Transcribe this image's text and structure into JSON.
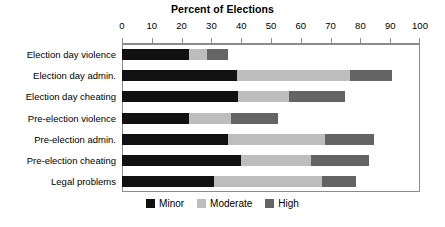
{
  "chart_data": {
    "type": "bar",
    "orientation": "horizontal",
    "stacked": true,
    "title": "Percent of Elections",
    "xlabel": "",
    "ylabel": "",
    "xlim": [
      0,
      100
    ],
    "grid": false,
    "legend_position": "bottom",
    "tick_labels": [
      "0",
      "10",
      "20",
      "30",
      "40",
      "50",
      "60",
      "70",
      "80",
      "90",
      "100"
    ],
    "tick_values": [
      0,
      10,
      20,
      30,
      40,
      50,
      60,
      70,
      80,
      90,
      100
    ],
    "categories": [
      "Election day violence",
      "Election day admin.",
      "Election day cheating",
      "Pre-election violence",
      "Pre-election admin.",
      "Pre-election cheating",
      "Legal problems"
    ],
    "series": [
      {
        "name": "Minor",
        "color": "#111111",
        "values": [
          22.5,
          38.5,
          39,
          22.5,
          35.5,
          40,
          31
        ]
      },
      {
        "name": "Moderate",
        "color": "#bdbdbd",
        "values": [
          6,
          38,
          17,
          14,
          32.5,
          23.5,
          36
        ]
      },
      {
        "name": "High",
        "color": "#646464",
        "values": [
          7,
          14,
          19,
          16,
          16.5,
          19.5,
          11.5
        ]
      }
    ],
    "totals": [
      35.5,
      90.5,
      75,
      52.5,
      84.5,
      83,
      78.5
    ]
  },
  "legend": {
    "items": [
      {
        "label": "Minor",
        "color": "#111111"
      },
      {
        "label": "Moderate",
        "color": "#bdbdbd"
      },
      {
        "label": "High",
        "color": "#646464"
      }
    ]
  }
}
